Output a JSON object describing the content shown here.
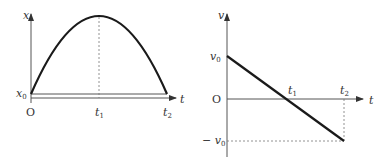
{
  "diagrams": [
    {
      "name": "position-time-graph",
      "y_axis_label": "x",
      "x_axis_label": "t",
      "origin_label": "O",
      "y_tick_label": {
        "base": "x",
        "sub": "0"
      },
      "x_tick_labels": [
        {
          "base": "t",
          "sub": "1"
        },
        {
          "base": "t",
          "sub": "2"
        }
      ],
      "curve": "parabola from (0, x0) peaking at t1, returning to x0 at t2"
    },
    {
      "name": "velocity-time-graph",
      "y_axis_label": "v",
      "x_axis_label": "t",
      "origin_label": "O",
      "y_tick_labels": [
        {
          "prefix": "",
          "base": "v",
          "sub": "0"
        },
        {
          "prefix": "− ",
          "base": "v",
          "sub": "0"
        }
      ],
      "x_tick_labels": [
        {
          "base": "t",
          "sub": "1"
        },
        {
          "base": "t",
          "sub": "2"
        }
      ],
      "curve": "straight line from v0 at t=0 through 0 at t1 to -v0 at t2"
    }
  ],
  "colors": {
    "curve": "#1a1a1a",
    "axis": "#555555",
    "dashed": "#777777",
    "background": "#ffffff"
  }
}
